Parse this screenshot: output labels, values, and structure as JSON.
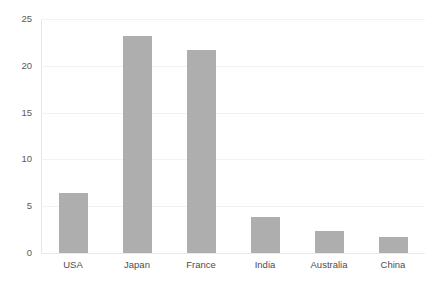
{
  "chart_data": {
    "type": "bar",
    "title": "",
    "subtitle": "",
    "xlabel": "",
    "ylabel": "",
    "categories": [
      "USA",
      "Japan",
      "France",
      "India",
      "Australia",
      "China"
    ],
    "values": [
      6.4,
      23.2,
      21.7,
      3.8,
      2.4,
      1.7
    ],
    "series": [
      {
        "name": "",
        "values": [
          6.4,
          23.2,
          21.7,
          3.8,
          2.4,
          1.7
        ]
      }
    ],
    "ylim": [
      0,
      25
    ],
    "y_ticks": [
      0,
      5,
      10,
      15,
      20,
      25
    ],
    "y_tick_labels": [
      "0",
      "5",
      "10",
      "15",
      "20",
      "25"
    ],
    "grid": "horizontal",
    "legend": "none",
    "bar_color": "#aeaeae",
    "gridline_color": "#f2f2f2",
    "axis_color": "#e6e6e6",
    "background_color": "#ffffff",
    "tick_label_color": "#4d4d4d"
  }
}
